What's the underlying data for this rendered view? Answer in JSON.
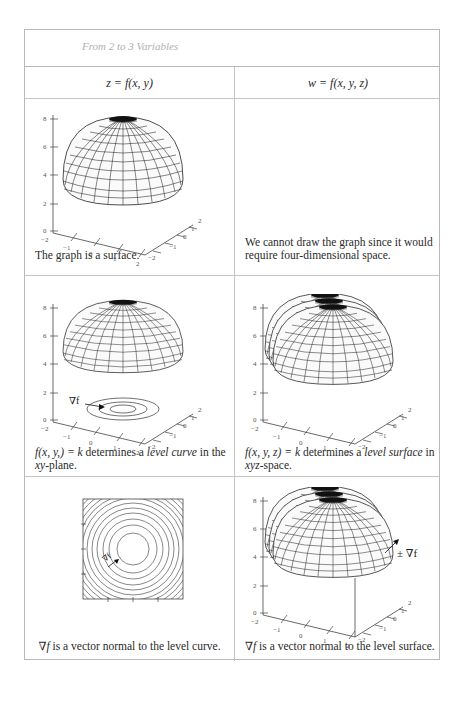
{
  "table": {
    "title": "From 2 to 3 Variables",
    "columns": [
      {
        "header": "z = f(x, y)"
      },
      {
        "header": "w = f(x, y, z)"
      }
    ],
    "rows": [
      {
        "left": {
          "figure": "paraboloid-surface-3d",
          "caption": "The graph is a surface."
        },
        "right": {
          "figure": "none",
          "caption": "We cannot draw the graph since it would require four-dimensional space."
        }
      },
      {
        "left": {
          "figure": "surface-with-level-curves",
          "caption_parts": [
            "f(x, y,) = k",
            " determines a ",
            "level curve",
            " in the ",
            "xy",
            "-plane."
          ],
          "gradient_label": "∇f"
        },
        "right": {
          "figure": "nested-level-surfaces",
          "caption_parts": [
            "f(x, y, z) = k",
            " determines a ",
            "level surface",
            " in ",
            "xyz",
            "-space."
          ]
        }
      },
      {
        "left": {
          "figure": "contour-plot",
          "caption_parts": [
            "∇f",
            " is a vector normal to the level curve."
          ],
          "gradient_label": "∇f"
        },
        "right": {
          "figure": "level-surfaces-with-normal",
          "caption_parts": [
            "∇f",
            " is a vector normal to the level surface."
          ],
          "gradient_label": "± ∇f"
        }
      }
    ]
  },
  "axes": {
    "z_ticks": [
      "0",
      "2",
      "4",
      "6",
      "8"
    ],
    "x_ticks": [
      "−2",
      "−1",
      "0",
      "1",
      "2"
    ],
    "y_ticks": [
      "−2",
      "−1",
      "0",
      "1",
      "2"
    ]
  }
}
